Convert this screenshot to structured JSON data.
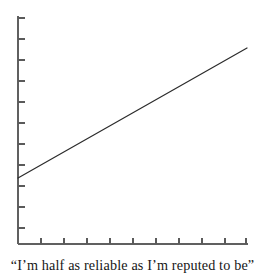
{
  "figure": {
    "caption": "“I’m half as reliable as I’m reputed to be”",
    "background_color": "#ffffff",
    "ink_color": "#2b2b2b",
    "axis_color": "#555555"
  },
  "chart_data": {
    "type": "line",
    "title": "",
    "subtitle": "",
    "xlabel": "",
    "ylabel": "",
    "annotations": [
      "“I’m half as reliable as I’m reputed to be”"
    ],
    "legend": [],
    "legend_position": "none",
    "grid": false,
    "xlim": [
      0,
      10
    ],
    "ylim": [
      0,
      11
    ],
    "x_tick_labels": [
      "",
      "",
      "",
      "",
      "",
      "",
      "",
      "",
      "",
      ""
    ],
    "y_tick_labels": [
      "",
      "",
      "",
      "",
      "",
      "",
      "",
      "",
      "",
      "",
      ""
    ],
    "x_tick_count": 10,
    "y_tick_count": 11,
    "series": [
      {
        "name": "trend",
        "color": "#2b2b2b",
        "style": "solid",
        "x": [
          0.0,
          10.0
        ],
        "y": [
          3.3,
          9.1
        ],
        "slope": 0.58,
        "intercept": 3.3
      }
    ]
  },
  "geometry": {
    "axis_left_x": 18,
    "axis_bottom_y": 244,
    "axis_top_y": 16,
    "axis_right_x": 248,
    "line_start": {
      "x": 18,
      "y": 178
    },
    "line_end": {
      "x": 247,
      "y": 48
    },
    "y_ticks_y": [
      18,
      39,
      60,
      81,
      102,
      123,
      144,
      165,
      186,
      207,
      228
    ],
    "x_ticks_x": [
      41,
      64,
      87,
      110,
      133,
      156,
      179,
      202,
      225,
      246
    ],
    "tick_length_y": 7,
    "tick_length_x": 6
  }
}
